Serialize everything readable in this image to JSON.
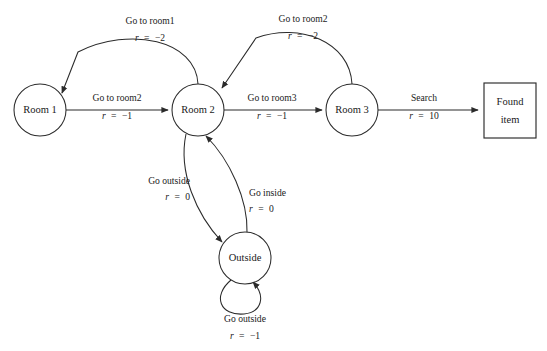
{
  "diagram": {
    "background_color": "#ffffff",
    "stroke_color": "#2b2b2b",
    "nodes": [
      {
        "id": "room1",
        "label": "Room 1",
        "shape": "circle",
        "cx": 40,
        "cy": 110,
        "r": 26
      },
      {
        "id": "room2",
        "label": "Room 2",
        "shape": "circle",
        "cx": 198,
        "cy": 110,
        "r": 26
      },
      {
        "id": "room3",
        "label": "Room 3",
        "shape": "circle",
        "cx": 352,
        "cy": 110,
        "r": 26
      },
      {
        "id": "outside",
        "label": "Outside",
        "shape": "circle",
        "cx": 245,
        "cy": 258,
        "r": 26
      },
      {
        "id": "found",
        "label_line1": "Found",
        "label_line2": "item",
        "shape": "rect",
        "x": 484,
        "y": 83,
        "width": 52,
        "height": 55
      }
    ],
    "edges": [
      {
        "id": "room1-to-room2",
        "from": "room1",
        "to": "room2",
        "action": "Go to room2",
        "reward_var": "r",
        "reward_eq": "=",
        "reward_value": "−1"
      },
      {
        "id": "room2-to-room1",
        "from": "room2",
        "to": "room1",
        "action": "Go to room1",
        "reward_var": "r",
        "reward_eq": "=",
        "reward_value": "−2"
      },
      {
        "id": "room2-to-room3",
        "from": "room2",
        "to": "room3",
        "action": "Go to room3",
        "reward_var": "r",
        "reward_eq": "=",
        "reward_value": "−1"
      },
      {
        "id": "room3-to-room2",
        "from": "room3",
        "to": "room2",
        "action": "Go to room2",
        "reward_var": "r",
        "reward_eq": "=",
        "reward_value": "−2"
      },
      {
        "id": "room3-to-found",
        "from": "room3",
        "to": "found",
        "action": "Search",
        "reward_var": "r",
        "reward_eq": "=",
        "reward_value": "10"
      },
      {
        "id": "room2-to-outside",
        "from": "room2",
        "to": "outside",
        "action": "Go outside",
        "reward_var": "r",
        "reward_eq": "=",
        "reward_value": "0"
      },
      {
        "id": "outside-to-room2",
        "from": "outside",
        "to": "room2",
        "action": "Go inside",
        "reward_var": "r",
        "reward_eq": "=",
        "reward_value": "0"
      },
      {
        "id": "outside-self-loop",
        "from": "outside",
        "to": "outside",
        "action": "Go outside",
        "reward_var": "r",
        "reward_eq": "=",
        "reward_value": "−1"
      }
    ]
  }
}
